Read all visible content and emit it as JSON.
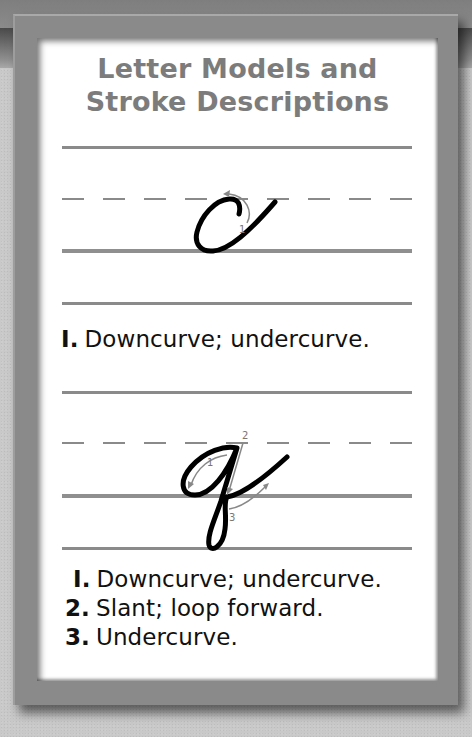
{
  "title": {
    "line1": "Letter Models and",
    "line2": "Stroke Descriptions"
  },
  "colors": {
    "title": "#7c7c7c",
    "frame": "#8a8a8a",
    "rule": "#8a8a8a",
    "letter": "#000000",
    "arrow": "#888888"
  },
  "models": [
    {
      "letter": "c",
      "style": "cursive lowercase",
      "stroke_labels": [
        "1"
      ],
      "steps": [
        {
          "num": "I.",
          "text": "Downcurve; undercurve."
        }
      ]
    },
    {
      "letter": "q",
      "style": "cursive lowercase",
      "stroke_labels": [
        "1",
        "2",
        "3"
      ],
      "steps": [
        {
          "num": "I.",
          "text": "Downcurve; undercurve."
        },
        {
          "num": "2.",
          "text": "Slant; loop forward."
        },
        {
          "num": "3.",
          "text": "Undercurve."
        }
      ]
    }
  ]
}
